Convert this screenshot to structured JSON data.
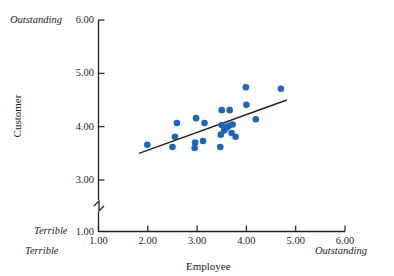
{
  "chart_data": {
    "type": "scatter",
    "title": "",
    "xlabel": "Employee",
    "ylabel": "Customer",
    "xlim": [
      1.0,
      6.0
    ],
    "ylim": [
      1.0,
      6.0
    ],
    "grid": false,
    "legend": null,
    "y_axis_break": true,
    "y_axis_break_between": [
      1.0,
      3.0
    ],
    "x_ticks": [
      "1.00",
      "2.00",
      "3.00",
      "4.00",
      "5.00",
      "6.00"
    ],
    "y_ticks": [
      "1.00",
      "3.00",
      "4.00",
      "5.00",
      "6.00"
    ],
    "x_anchor_low_label": "Terrible",
    "x_anchor_high_label": "Outstanding",
    "y_anchor_low_label": "Terrible",
    "y_anchor_high_label": "Outstanding",
    "marker_color": "#1f66b5",
    "line_color": "#231f20",
    "points": [
      {
        "x": 1.99,
        "y": 3.66
      },
      {
        "x": 2.5,
        "y": 3.62
      },
      {
        "x": 2.55,
        "y": 3.81
      },
      {
        "x": 2.59,
        "y": 4.07
      },
      {
        "x": 2.95,
        "y": 3.6
      },
      {
        "x": 2.96,
        "y": 3.7
      },
      {
        "x": 2.98,
        "y": 4.16
      },
      {
        "x": 3.12,
        "y": 3.73
      },
      {
        "x": 3.15,
        "y": 4.07
      },
      {
        "x": 3.47,
        "y": 3.62
      },
      {
        "x": 3.48,
        "y": 3.85
      },
      {
        "x": 3.5,
        "y": 4.03
      },
      {
        "x": 3.5,
        "y": 4.31
      },
      {
        "x": 3.55,
        "y": 3.93
      },
      {
        "x": 3.58,
        "y": 3.97
      },
      {
        "x": 3.62,
        "y": 4.0
      },
      {
        "x": 3.65,
        "y": 4.02
      },
      {
        "x": 3.66,
        "y": 4.31
      },
      {
        "x": 3.7,
        "y": 3.88
      },
      {
        "x": 3.72,
        "y": 4.04
      },
      {
        "x": 3.78,
        "y": 3.81
      },
      {
        "x": 3.99,
        "y": 4.74
      },
      {
        "x": 4.0,
        "y": 4.41
      },
      {
        "x": 4.19,
        "y": 4.14
      },
      {
        "x": 4.7,
        "y": 4.71
      }
    ],
    "trend_line": {
      "x1": 1.82,
      "y1": 3.5,
      "x2": 4.82,
      "y2": 4.5
    }
  },
  "axes": {
    "y_top_anchor": "Outstanding",
    "y_bottom_anchor": "Terrible",
    "x_left_anchor": "Terrible",
    "x_right_anchor": "Outstanding",
    "x_title": "Employee",
    "y_title": "Customer",
    "y_tick_labels": [
      "6.00",
      "5.00",
      "4.00",
      "3.00",
      "1.00"
    ],
    "x_tick_labels": [
      "1.00",
      "2.00",
      "3.00",
      "4.00",
      "5.00",
      "6.00"
    ]
  }
}
